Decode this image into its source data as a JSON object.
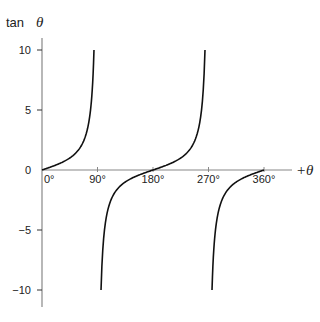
{
  "chart_data": {
    "type": "line",
    "title": "",
    "ylabel": "tan",
    "ylabel_symbol": "θ",
    "xlabel": "+θ",
    "xlim": [
      0,
      360
    ],
    "ylim": [
      -10,
      10
    ],
    "x_ticks": [
      {
        "value": 0,
        "label": "0°"
      },
      {
        "value": 90,
        "label": "90°"
      },
      {
        "value": 180,
        "label": "180°"
      },
      {
        "value": 270,
        "label": "270°"
      },
      {
        "value": 360,
        "label": "360°"
      }
    ],
    "y_ticks": [
      {
        "value": 10,
        "label": "10"
      },
      {
        "value": 5,
        "label": "5"
      },
      {
        "value": 0,
        "label": "0"
      },
      {
        "value": -5,
        "label": "−5"
      },
      {
        "value": -10,
        "label": "−10"
      }
    ],
    "grid": false,
    "series": [
      {
        "name": "tan θ branch 1",
        "function": "tan",
        "x_range": [
          0,
          84.3
        ]
      },
      {
        "name": "tan θ branch 2",
        "function": "tan",
        "x_range": [
          95.7,
          264.3
        ]
      },
      {
        "name": "tan θ branch 3",
        "function": "tan",
        "x_range": [
          275.7,
          360
        ]
      }
    ],
    "colors": {
      "curve": "#111111",
      "axis": "#888888"
    }
  }
}
